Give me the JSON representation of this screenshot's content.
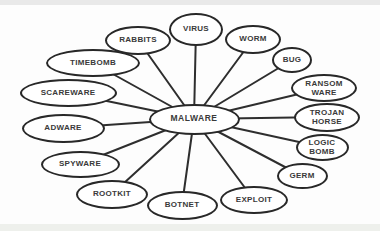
{
  "diagram": {
    "stroke_color": "#2e2e2e",
    "node_fill_color": "#ffffff",
    "text_color": "#3a3a3a",
    "background_color": "#fdfdfd",
    "center": {
      "label": "MALWARE",
      "x": 194,
      "y": 119,
      "w": 91,
      "h": 31
    },
    "nodes": [
      {
        "label": "VIRUS",
        "x": 196,
        "y": 29,
        "w": 54,
        "h": 33
      },
      {
        "label": "WORM",
        "x": 253,
        "y": 39,
        "w": 56,
        "h": 29
      },
      {
        "label": "BUG",
        "x": 292,
        "y": 60,
        "w": 40,
        "h": 26
      },
      {
        "label": "RANSOM\nWARE",
        "x": 324,
        "y": 88,
        "w": 66,
        "h": 28
      },
      {
        "label": "TROJAN\nHORSE",
        "x": 327,
        "y": 117,
        "w": 66,
        "h": 29
      },
      {
        "label": "LOGIC\nBOMB",
        "x": 322,
        "y": 147,
        "w": 53,
        "h": 27
      },
      {
        "label": "GERM",
        "x": 302,
        "y": 176,
        "w": 51,
        "h": 26
      },
      {
        "label": "EXPLOIT",
        "x": 254,
        "y": 200,
        "w": 68,
        "h": 28
      },
      {
        "label": "BOTNET",
        "x": 182,
        "y": 205,
        "w": 71,
        "h": 29
      },
      {
        "label": "ROOTKIT",
        "x": 112,
        "y": 194,
        "w": 72,
        "h": 29
      },
      {
        "label": "SPYWARE",
        "x": 80,
        "y": 164,
        "w": 79,
        "h": 27
      },
      {
        "label": "ADWARE",
        "x": 63,
        "y": 128,
        "w": 83,
        "h": 29
      },
      {
        "label": "SCAREWARE",
        "x": 68,
        "y": 93,
        "w": 97,
        "h": 28
      },
      {
        "label": "TIMEBOMB",
        "x": 93,
        "y": 63,
        "w": 94,
        "h": 28
      },
      {
        "label": "RABBITS",
        "x": 138,
        "y": 40,
        "w": 66,
        "h": 29
      }
    ]
  }
}
